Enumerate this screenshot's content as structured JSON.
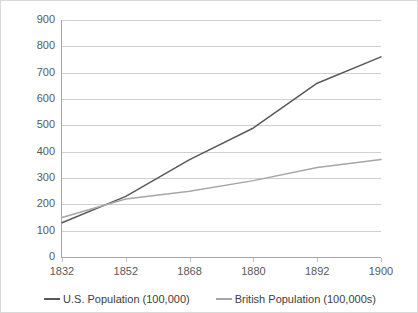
{
  "chart_data": {
    "type": "line",
    "title": "",
    "xlabel": "",
    "ylabel": "",
    "x": [
      1832,
      1852,
      1868,
      1880,
      1892,
      1900
    ],
    "categories": [
      "1832",
      "1852",
      "1868",
      "1880",
      "1892",
      "1900"
    ],
    "ylim": [
      0,
      900
    ],
    "yticks": [
      0,
      100,
      200,
      300,
      400,
      500,
      600,
      700,
      800,
      900
    ],
    "ytick_labels": [
      "0",
      "100",
      "200",
      "300",
      "400",
      "500",
      "600",
      "700",
      "800",
      "900"
    ],
    "grid": "horizontal",
    "legend_position": "bottom",
    "series": [
      {
        "name": "U.S. Population (100,000)",
        "color": "#595959",
        "values": [
          130,
          230,
          370,
          490,
          660,
          760
        ]
      },
      {
        "name": "British Population (100,000s)",
        "color": "#a6a6a6",
        "values": [
          150,
          220,
          250,
          290,
          340,
          370
        ]
      }
    ]
  },
  "legend": {
    "items": [
      {
        "label": "U.S. Population (100,000)",
        "color": "#595959"
      },
      {
        "label": "British Population (100,000s)",
        "color": "#a6a6a6"
      }
    ]
  },
  "colors": {
    "us_line": "#595959",
    "british_line": "#a6a6a6",
    "gridline": "#d0d0d0",
    "axis": "#a6a6a6",
    "text": "#595959",
    "border": "#d9d9d9",
    "background": "#ffffff"
  }
}
